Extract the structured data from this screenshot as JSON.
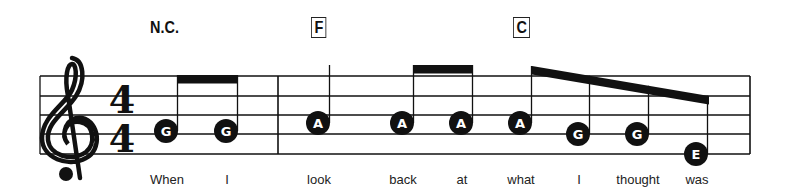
{
  "score": {
    "clef": "treble",
    "time_signature": {
      "top": "4",
      "bottom": "4"
    },
    "staff": {
      "left": 40,
      "right": 750,
      "lines_y": [
        76,
        96,
        115,
        134,
        154
      ],
      "barlines_x": [
        278,
        750
      ],
      "color": "#111111"
    },
    "chords": [
      {
        "label": "N.C.",
        "boxed": false,
        "x": 150,
        "y": 19
      },
      {
        "label": "F",
        "boxed": true,
        "x": 311,
        "y": 17
      },
      {
        "label": "C",
        "boxed": true,
        "x": 513,
        "y": 17
      }
    ],
    "notes": [
      {
        "letter": "G",
        "x": 166,
        "y": 131,
        "lyric": "When"
      },
      {
        "letter": "G",
        "x": 226,
        "y": 131,
        "lyric": "I"
      },
      {
        "letter": "A",
        "x": 318,
        "y": 123,
        "lyric": "look"
      },
      {
        "letter": "A",
        "x": 402,
        "y": 123,
        "lyric": "back"
      },
      {
        "letter": "A",
        "x": 461,
        "y": 123,
        "lyric": "at"
      },
      {
        "letter": "A",
        "x": 520,
        "y": 123,
        "lyric": "what"
      },
      {
        "letter": "G",
        "x": 578,
        "y": 134,
        "lyric": "I"
      },
      {
        "letter": "G",
        "x": 637,
        "y": 134,
        "lyric": "thought"
      },
      {
        "letter": "E",
        "x": 696,
        "y": 154,
        "lyric": "was"
      }
    ],
    "beams": [
      {
        "notes": [
          0,
          1
        ],
        "x1": 177,
        "y1": 75,
        "x2": 238,
        "y2": 75
      },
      {
        "notes": [
          3,
          4
        ],
        "x1": 414,
        "y1": 65,
        "x2": 473,
        "y2": 65
      },
      {
        "notes": [
          5,
          6,
          7,
          8
        ],
        "x1": 532,
        "y1": 66,
        "x2": 709,
        "y2": 96
      }
    ],
    "single_stems": [
      {
        "note": 2,
        "top": 65
      }
    ]
  }
}
